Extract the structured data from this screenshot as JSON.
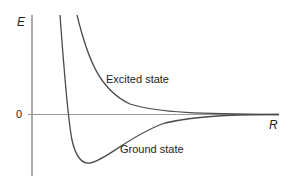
{
  "diagram": {
    "y_axis_label": "E",
    "x_axis_label": "R",
    "zero_label": "0",
    "curves": [
      {
        "name": "Excited state",
        "label": "Excited state",
        "type": "repulsive"
      },
      {
        "name": "Ground state",
        "label": "Ground state",
        "type": "bound"
      }
    ],
    "colors": {
      "curve": "#4a4a4a",
      "axis": "#888888",
      "text": "#222222"
    }
  }
}
